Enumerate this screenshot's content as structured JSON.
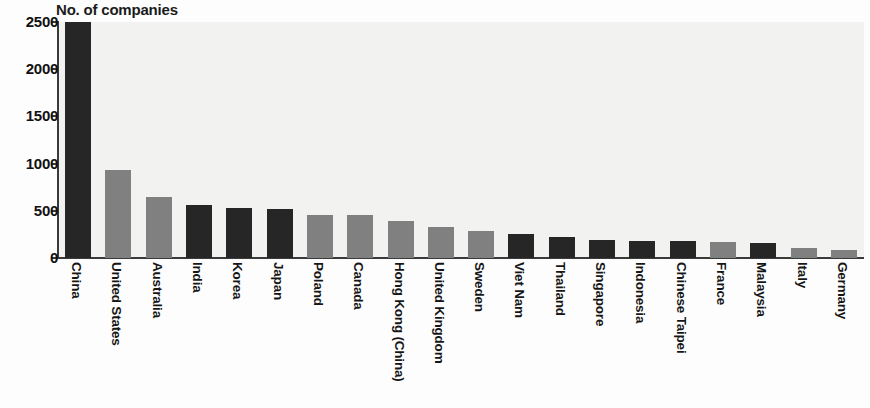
{
  "chart_data": {
    "type": "bar",
    "title": "No. of companies",
    "xlabel": "",
    "ylabel": "",
    "ylim": [
      0,
      2500
    ],
    "yticks": [
      0,
      500,
      1000,
      1500,
      2000,
      2500
    ],
    "ytick_labels": [
      "0",
      "500",
      "1000",
      "1500",
      "2000",
      "2500"
    ],
    "grid": false,
    "legend": null,
    "note": "China bar is clipped at the top of the axis (value exceeds 2500)",
    "categories": [
      "China",
      "United States",
      "Australia",
      "India",
      "Korea",
      "Japan",
      "Poland",
      "Canada",
      "Hong Kong (China)",
      "United Kingdom",
      "Sweden",
      "Viet Nam",
      "Thailand",
      "Singapore",
      "Indonesia",
      "Chinese Taipei",
      "France",
      "Malaysia",
      "Italy",
      "Germany"
    ],
    "values": [
      2500,
      930,
      650,
      565,
      535,
      520,
      460,
      455,
      390,
      330,
      290,
      250,
      225,
      195,
      180,
      180,
      170,
      160,
      105,
      90
    ],
    "bar_colors": [
      "#262626",
      "#808080",
      "#808080",
      "#262626",
      "#262626",
      "#262626",
      "#808080",
      "#808080",
      "#808080",
      "#808080",
      "#808080",
      "#262626",
      "#262626",
      "#262626",
      "#262626",
      "#262626",
      "#808080",
      "#262626",
      "#808080",
      "#808080"
    ],
    "colors": {
      "dark_bar": "#262626",
      "gray_bar": "#808080",
      "plot_background": "#f2f2f0",
      "axis": "#3a3a3a",
      "text": "#111111"
    }
  }
}
